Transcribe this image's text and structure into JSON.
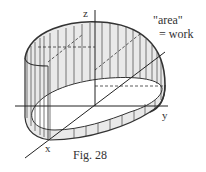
{
  "figure": {
    "caption": "Fig. 28",
    "annotation_line1": "\"area\"",
    "annotation_line2": "= work",
    "axes": {
      "x": "x",
      "y": "y",
      "z": "z"
    },
    "colors": {
      "stroke": "#333333",
      "fill": "#e6e6e6",
      "background": "#ffffff"
    }
  }
}
